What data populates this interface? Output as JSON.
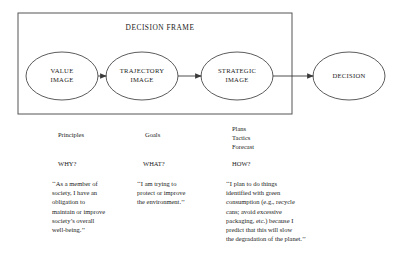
{
  "diagram": {
    "frame_label": "DECISION FRAME",
    "nodes": [
      {
        "id": "value-image",
        "lines": [
          "VALUE",
          "IMAGE"
        ],
        "cx": 62,
        "cy": 76,
        "rx": 36,
        "ry": 24
      },
      {
        "id": "trajectory-image",
        "lines": [
          "TRAJECTORY",
          "IMAGE"
        ],
        "cx": 142,
        "cy": 76,
        "rx": 36,
        "ry": 24
      },
      {
        "id": "strategic-image",
        "lines": [
          "STRATEGIC",
          "IMAGE"
        ],
        "cx": 237,
        "cy": 76,
        "rx": 36,
        "ry": 24
      },
      {
        "id": "decision",
        "lines": [
          "DECISION"
        ],
        "cx": 349,
        "cy": 76,
        "rx": 36,
        "ry": 24
      }
    ],
    "frame": {
      "x": 18,
      "y": 13,
      "width": 274,
      "height": 101
    },
    "arrows": [
      {
        "from": "value-image",
        "to": "trajectory-image"
      },
      {
        "from": "trajectory-image",
        "to": "strategic-image"
      },
      {
        "from": "strategic-image",
        "to": "decision"
      }
    ],
    "stroke_color": "#4a4a4a",
    "fill_color": "#ffffff"
  },
  "columns": [
    {
      "id": "value",
      "headings": [
        "Principles"
      ],
      "question": "WHY?",
      "quote_lines": [
        "‘‘As a member of",
        "society, I have an",
        "obligation to",
        "maintain or improve",
        "society’s overall",
        "well-being.’’"
      ]
    },
    {
      "id": "trajectory",
      "headings": [
        "Goals"
      ],
      "question": "WHAT?",
      "quote_lines": [
        "‘‘I am trying to",
        "protect or improve",
        "the environment.’’"
      ]
    },
    {
      "id": "strategic",
      "headings": [
        "Plans",
        "Tactics",
        "Forecast"
      ],
      "question": "HOW?",
      "quote_lines": [
        "‘‘I plan to do things",
        "identified with green",
        "consumption (e.g., recycle",
        "cans; avoid excessive",
        "packaging, etc.) because I",
        "predict that this will slow",
        "the degradation of the planet.’’"
      ]
    }
  ]
}
